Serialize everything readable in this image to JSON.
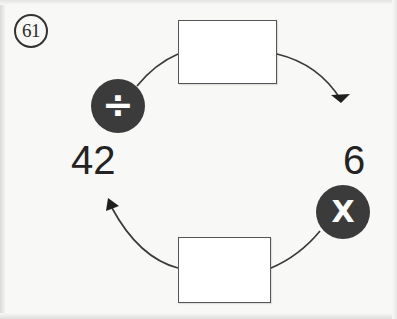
{
  "worksheet": {
    "problem_number": "61",
    "background_color": "#f8f8f7",
    "ink_color": "#2b2b2b"
  },
  "diagram": {
    "type": "cycle-flow",
    "badge_color": "#3b3b3b",
    "badge_glyph_color": "#ffffff",
    "nodes": [
      {
        "id": "value-left",
        "kind": "value",
        "label": "42"
      },
      {
        "id": "value-right",
        "kind": "value",
        "label": "6"
      },
      {
        "id": "op-divide",
        "kind": "operator",
        "label": "÷",
        "icon": "divide-icon"
      },
      {
        "id": "op-multiply",
        "kind": "operator",
        "label": "X",
        "icon": "multiply-icon"
      },
      {
        "id": "box-top",
        "kind": "answer-box",
        "label": ""
      },
      {
        "id": "box-bottom",
        "kind": "answer-box",
        "label": ""
      }
    ],
    "arrows": [
      {
        "id": "arrow-top",
        "from": "op-divide",
        "to": "value-right",
        "direction": "clockwise",
        "arrowhead": "end"
      },
      {
        "id": "arrow-bottom",
        "from": "op-multiply",
        "to": "value-left",
        "direction": "clockwise",
        "arrowhead": "end"
      }
    ]
  }
}
